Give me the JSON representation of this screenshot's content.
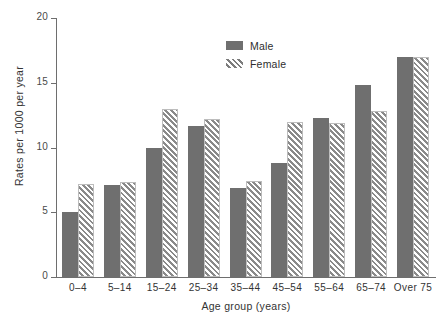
{
  "chart_data": {
    "type": "bar",
    "title": "",
    "xlabel": "Age group (years)",
    "ylabel": "Rates per 1000 per year",
    "categories": [
      "0–4",
      "5–14",
      "15–24",
      "25–34",
      "35–44",
      "45–54",
      "55–64",
      "65–74",
      "Over 75"
    ],
    "series": [
      {
        "name": "Male",
        "values": [
          5.0,
          7.1,
          10.0,
          11.7,
          6.9,
          8.8,
          12.3,
          14.8,
          17.0
        ]
      },
      {
        "name": "Female",
        "values": [
          7.2,
          7.3,
          13.0,
          12.2,
          7.4,
          12.0,
          11.9,
          12.8,
          17.0
        ]
      }
    ],
    "ylim": [
      0,
      20
    ],
    "yticks": [
      "0",
      "5",
      "10",
      "15",
      "20"
    ],
    "ytick_values": [
      0,
      5,
      10,
      15,
      20
    ],
    "grid": false,
    "legend_position": "top-center",
    "colors": {
      "male": "#6f6f6f",
      "female_hatch": "#8a8a8a",
      "axis": "#6e6e6e",
      "text": "#333333",
      "background": "#ffffff"
    }
  },
  "legend": {
    "items": [
      {
        "label": "Male",
        "style": "solid-gray-swatch"
      },
      {
        "label": "Female",
        "style": "diagonal-hatch-swatch"
      }
    ]
  }
}
